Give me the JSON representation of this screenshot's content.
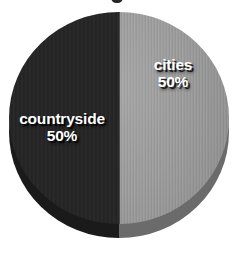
{
  "chart_data": {
    "type": "pie",
    "title": "",
    "xlabel": "",
    "ylabel": "",
    "categories": [
      "countryside",
      "cities"
    ],
    "values": [
      50,
      50
    ],
    "value_unit": "%",
    "labels": [
      {
        "name": "countryside",
        "value": "50%"
      },
      {
        "name": "cities",
        "value": "50%"
      }
    ],
    "slices": [
      {
        "name": "countryside",
        "value": 50,
        "display_value": "50%",
        "color": "#262626",
        "side_color": "#1a1a1a",
        "start_angle": 180,
        "end_angle": 360
      },
      {
        "name": "cities",
        "value": 50,
        "display_value": "50%",
        "color": "#9c9c9c",
        "side_color": "#6b6b6b",
        "start_angle": 0,
        "end_angle": 180
      }
    ],
    "total": 100,
    "legend": "none",
    "legend_position": "inside-slices",
    "grid": false,
    "three_d": true,
    "background_color": "#ffffff",
    "label_text_color": "#ffffff",
    "annotations": []
  },
  "figure": {
    "background_color": "#ffffff",
    "title_remnant_present": true
  }
}
